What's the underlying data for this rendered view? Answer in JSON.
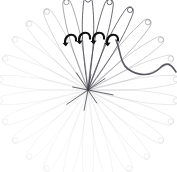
{
  "canvas": {
    "width": 177,
    "height": 172,
    "background": "#ffffff",
    "title": "radial-petal-trail-diagram"
  },
  "chart_data": {
    "type": "scatter",
    "title": "",
    "xlabel": "",
    "ylabel": "",
    "center": {
      "x": 88,
      "y": 90
    },
    "petal_count": 26,
    "angle_start_deg": -90,
    "angle_step_deg": 13.846,
    "radius_px": 88,
    "petal_half_width_px": 7,
    "tip_marker_radius_px": 2.6,
    "stroke_color": "#4a4a52",
    "series": [
      {
        "name": "petal_index",
        "values": [
          0,
          1,
          2,
          3,
          4,
          5,
          6,
          7,
          8,
          9,
          10,
          11,
          12,
          13,
          14,
          15,
          16,
          17,
          18,
          19,
          20,
          21,
          22,
          23,
          24,
          25
        ]
      },
      {
        "name": "angle_deg",
        "values": [
          -90,
          -76.2,
          -62.3,
          -48.5,
          -34.6,
          -20.8,
          -6.9,
          6.9,
          20.8,
          34.6,
          48.5,
          62.3,
          76.2,
          90,
          103.8,
          117.7,
          131.5,
          145.4,
          159.2,
          173.1,
          186.9,
          200.8,
          214.6,
          228.5,
          242.3,
          256.2
        ]
      },
      {
        "name": "opacity",
        "values": [
          1.0,
          0.96,
          0.92,
          0.44,
          0.3,
          0.22,
          0.17,
          0.14,
          0.12,
          0.1,
          0.09,
          0.08,
          0.07,
          0.07,
          0.06,
          0.06,
          0.06,
          0.07,
          0.07,
          0.08,
          0.09,
          0.1,
          0.12,
          0.16,
          0.26,
          0.55
        ]
      },
      {
        "name": "radius_px",
        "values": [
          88,
          88,
          88,
          88,
          86,
          86,
          86,
          86,
          86,
          86,
          86,
          86,
          86,
          86,
          86,
          86,
          86,
          86,
          86,
          86,
          86,
          86,
          86,
          86,
          86,
          88
        ]
      }
    ],
    "grid": false,
    "legend": null
  },
  "overlays": {
    "rotation_arrows": {
      "name": "rotation-arrow-group",
      "count": 4,
      "color": "#111111",
      "stroke_width": 2.1,
      "positions": [
        {
          "x": 70,
          "y": 40
        },
        {
          "x": 84,
          "y": 38
        },
        {
          "x": 98,
          "y": 38
        },
        {
          "x": 112,
          "y": 40
        }
      ],
      "label": "curved rotation arrows"
    },
    "sweep_curve": {
      "name": "sweep-path",
      "color": "#57575f",
      "stroke_width": 1.6,
      "label": "S-shaped sweep trajectory from arrow cluster to right edge",
      "path": "M 116,40 C 121,52 120,63 128,69 C 139,77 152,76 160,68 C 167,61 171,64 176,72"
    },
    "core_rays": {
      "name": "core-ray-burst",
      "color": "#3c3c44",
      "count": 8,
      "label": "dark short rays at convergence point"
    }
  }
}
